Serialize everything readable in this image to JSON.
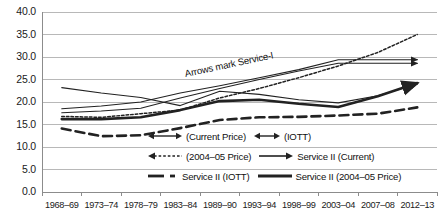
{
  "chart_data": {
    "type": "line",
    "title": "",
    "xlabel": "",
    "ylabel": "",
    "ylim": [
      0.0,
      40.0
    ],
    "grid": true,
    "legend_position": "inside-bottom-right",
    "annotations": [
      {
        "name": "arrows-note",
        "text": "Arrows mark Service-I"
      }
    ],
    "yticks": [
      "0.0",
      "5.0",
      "10.0",
      "15.0",
      "20.0",
      "25.0",
      "30.0",
      "35.0",
      "40.0"
    ],
    "categories": [
      "1968–69",
      "1973–74",
      "1978–79",
      "1983–84",
      "1989–90",
      "1993–94",
      "1998–99",
      "2003–04",
      "2007–08",
      "2012–13"
    ],
    "series": [
      {
        "name": "(Current Price)",
        "marker": "double-arrow",
        "style": "solid-thin",
        "values": [
          18.5,
          19.1,
          20.0,
          22.0,
          23.6,
          25.4,
          27.2,
          29.4,
          29.4,
          29.4
        ]
      },
      {
        "name": "(IOTT)",
        "marker": "short-double-arrow",
        "style": "solid-thin",
        "values": [
          17.6,
          18.0,
          18.6,
          20.9,
          23.0,
          25.0,
          26.9,
          28.6,
          28.6,
          28.6
        ]
      },
      {
        "name": "(2004–05 Price)",
        "marker": "left-arrow-dotted",
        "style": "dotted",
        "values": [
          16.8,
          16.6,
          17.4,
          18.2,
          20.9,
          23.0,
          25.4,
          28.0,
          31.0,
          35.0
        ]
      },
      {
        "name": "Service II (Current)",
        "marker": "line-arrow",
        "style": "solid-thin",
        "values": [
          23.2,
          22.0,
          21.0,
          19.2,
          22.4,
          21.7,
          20.5,
          19.8,
          21.4,
          24.0
        ]
      },
      {
        "name": "Service II (IOTT)",
        "marker": "dash-dot",
        "style": "dashed-thick",
        "values": [
          14.1,
          12.4,
          12.6,
          14.2,
          16.0,
          16.6,
          16.7,
          17.0,
          17.4,
          18.8
        ]
      },
      {
        "name": "Service II (2004–05 Price)",
        "marker": "solid-thick",
        "style": "solid-thick",
        "values": [
          16.2,
          16.2,
          16.6,
          18.2,
          20.2,
          20.5,
          19.6,
          18.9,
          21.3,
          24.2
        ]
      }
    ]
  },
  "legend": {
    "rows": [
      [
        {
          "label": "(Current Price)",
          "marker": "double-arrow"
        },
        {
          "label": "(IOTT)",
          "marker": "short-double-arrow"
        }
      ],
      [
        {
          "label": "(2004–05 Price)",
          "marker": "left-arrow-dotted"
        },
        {
          "label": "Service II (Current)",
          "marker": "line-arrow"
        }
      ],
      [
        {
          "label": "Service II (IOTT)",
          "marker": "dash-dot"
        },
        {
          "label": "Service II (2004–05 Price)",
          "marker": "solid-thick"
        }
      ]
    ]
  },
  "colors": {
    "line": "#222222",
    "grid": "#b8b8b8",
    "axis": "#8c8c8c",
    "text": "#1a1a1a",
    "background": "#ffffff"
  }
}
